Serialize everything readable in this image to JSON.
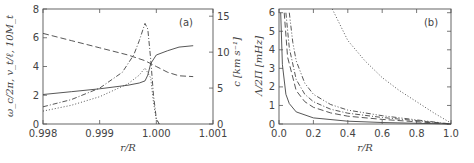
{
  "chart_data": [
    {
      "panel": "(a)",
      "type": "line",
      "xlabel": "r/R",
      "ylabel_left": "ω_c/2π, v_t/ℓ, 10M_t",
      "ylabel_right": "c [km s⁻¹]",
      "xlim": [
        0.998,
        1.001
      ],
      "ylim_left": [
        0,
        8
      ],
      "ylim_right": [
        0,
        16
      ],
      "x_ticks": [
        "0.998",
        "0.999",
        "1.000",
        "1.001"
      ],
      "y_ticks_left": [
        "0",
        "2",
        "4",
        "6",
        "8"
      ],
      "y_ticks_right": [
        "0",
        "5",
        "10",
        "15"
      ],
      "grid": false,
      "series": [
        {
          "name": "solid",
          "style": "solid",
          "x": [
            0.998,
            0.9985,
            0.999,
            0.9995,
            0.9997,
            0.9998,
            0.99985,
            0.9999,
            1.0,
            1.0002,
            1.0004,
            1.00065
          ],
          "y": [
            2.05,
            2.25,
            2.45,
            2.7,
            2.85,
            3.0,
            3.4,
            4.2,
            4.8,
            5.1,
            5.35,
            5.45
          ]
        },
        {
          "name": "dashed",
          "style": "dashed",
          "x": [
            0.998,
            0.9985,
            0.999,
            0.9995,
            0.9998,
            1.0,
            1.0002,
            1.0004,
            1.00065
          ],
          "y": [
            6.3,
            5.8,
            5.3,
            4.8,
            4.4,
            4.0,
            3.6,
            3.35,
            3.3
          ]
        },
        {
          "name": "dash-dot",
          "style": "dashdot",
          "x": [
            0.998,
            0.9985,
            0.999,
            0.9994,
            0.9996,
            0.9997,
            0.9998,
            0.99985,
            0.9999,
            0.99995,
            1.0,
            1.00005
          ],
          "y": [
            1.2,
            1.7,
            2.5,
            3.6,
            4.8,
            5.8,
            7.0,
            6.6,
            4.5,
            2.0,
            0.4,
            0.0
          ]
        },
        {
          "name": "dotted",
          "style": "dotted",
          "x": [
            0.998,
            0.9985,
            0.999,
            0.9995,
            0.9997,
            0.9998,
            0.9999,
            0.99995,
            1.0,
            1.00005
          ],
          "y": [
            0.9,
            1.3,
            1.9,
            2.8,
            3.4,
            3.9,
            3.2,
            1.5,
            0.3,
            0.0
          ]
        }
      ],
      "annotations": [
        "(a)"
      ]
    },
    {
      "panel": "(b)",
      "type": "line",
      "xlabel": "r/R",
      "ylabel": "Λ/2Π [mHz]",
      "xlim": [
        0.0,
        1.0
      ],
      "ylim": [
        0,
        6.2
      ],
      "x_ticks": [
        "0.0",
        "0.2",
        "0.4",
        "0.6",
        "0.8",
        "1.0"
      ],
      "y_ticks": [
        "0",
        "1",
        "2",
        "3",
        "4",
        "5",
        "6"
      ],
      "grid": false,
      "series": [
        {
          "name": "solid",
          "style": "solid",
          "x": [
            0.01,
            0.02,
            0.04,
            0.06,
            0.1,
            0.2,
            0.4,
            0.6,
            0.8,
            1.0
          ],
          "y": [
            6.0,
            3.2,
            1.6,
            1.1,
            0.65,
            0.33,
            0.15,
            0.08,
            0.04,
            0.0
          ]
        },
        {
          "name": "long-dash",
          "style": "dashed",
          "x": [
            0.03,
            0.05,
            0.1,
            0.15,
            0.2,
            0.3,
            0.4,
            0.6,
            0.8,
            1.0
          ],
          "y": [
            6.0,
            3.6,
            1.8,
            1.2,
            0.9,
            0.6,
            0.42,
            0.25,
            0.12,
            0.0
          ]
        },
        {
          "name": "dash-dot",
          "style": "dashdot",
          "x": [
            0.04,
            0.06,
            0.1,
            0.15,
            0.2,
            0.3,
            0.4,
            0.6,
            0.8,
            1.0
          ],
          "y": [
            6.0,
            4.1,
            2.4,
            1.6,
            1.2,
            0.8,
            0.58,
            0.35,
            0.18,
            0.0
          ]
        },
        {
          "name": "dash-dot-dot",
          "style": "dashdotdot",
          "x": [
            0.06,
            0.08,
            0.1,
            0.15,
            0.2,
            0.3,
            0.4,
            0.6,
            0.8,
            1.0
          ],
          "y": [
            6.0,
            4.4,
            3.4,
            2.2,
            1.6,
            1.05,
            0.75,
            0.45,
            0.22,
            0.0
          ]
        },
        {
          "name": "dotted",
          "style": "dotted",
          "x": [
            0.31,
            0.4,
            0.5,
            0.6,
            0.7,
            0.8,
            0.9,
            1.0
          ],
          "y": [
            6.2,
            4.5,
            3.4,
            2.5,
            1.8,
            1.2,
            0.6,
            0.05
          ]
        }
      ],
      "annotations": [
        "(b)"
      ]
    }
  ]
}
